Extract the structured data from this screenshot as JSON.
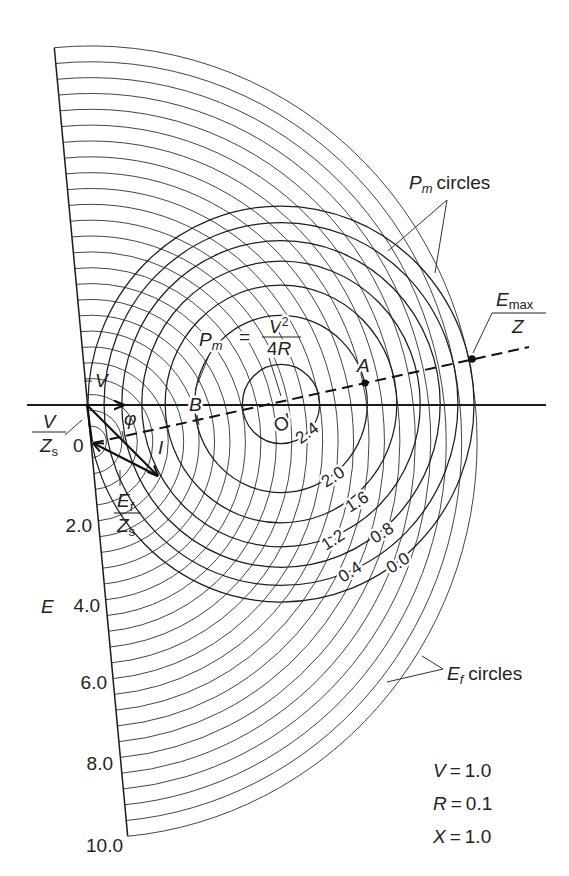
{
  "diagram": {
    "type": "circle-diagram",
    "ef_circle_values": [
      0.4,
      0.8,
      1.2,
      1.6,
      2.0,
      2.4,
      2.8,
      3.2,
      3.6,
      4.0,
      4.4,
      4.8,
      5.2,
      5.6,
      6.0,
      6.4,
      6.8,
      7.2,
      7.6,
      8.0,
      8.4,
      8.8,
      9.2,
      9.6,
      10.0
    ],
    "pm_circle_values": [
      0.0,
      0.4,
      0.8,
      1.2,
      1.6,
      2.0,
      2.4
    ],
    "parameters": [
      {
        "symbol": "V",
        "eq": "=",
        "value": "1.0"
      },
      {
        "symbol": "R",
        "eq": "=",
        "value": "0.1"
      },
      {
        "symbol": "X",
        "eq": "=",
        "value": "1.0"
      }
    ]
  },
  "labels": {
    "V": "V",
    "phi": "φ",
    "B": "B",
    "A": "A",
    "I": "I",
    "origin": "0",
    "o_prime": "O′",
    "V_over_Zs": {
      "num": "V",
      "den": "Z",
      "den_sub": "s"
    },
    "Ef_over_Zs": {
      "num": "E",
      "num_sub": "f",
      "den": "Z",
      "den_sub": "s"
    },
    "Pm_equation": {
      "lhs": "P",
      "lhs_sub": "m",
      "eq": "=",
      "num": "V",
      "num_sup": "2",
      "den_coef": "4",
      "den_var": "R"
    },
    "Emax_over_Z": {
      "num": "E",
      "num_sub": "max",
      "den": "Z"
    },
    "Pm_circles": {
      "symbol": "P",
      "sub": "m",
      "text": "circles"
    },
    "Ef_circles": {
      "symbol": "E",
      "sub": "f",
      "text": "circles"
    }
  },
  "e_axis": {
    "label": "E",
    "ticks": [
      "2.0",
      "4.0",
      "6.0",
      "8.0",
      "10.0"
    ]
  },
  "pm_labels": [
    "2.4",
    "2.0",
    "1.6",
    "1.2",
    "0.8",
    "0.4",
    "0.0"
  ]
}
